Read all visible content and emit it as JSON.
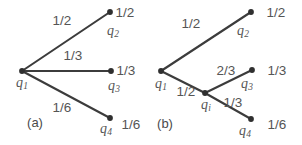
{
  "figure": {
    "caption_a": "(a)",
    "caption_b": "(b)",
    "stroke_color": "#3c3c3c",
    "text_color": "#4a4a4a",
    "background": "#ffffff"
  },
  "panel_a": {
    "root": {
      "name": "q",
      "sub": "1",
      "x": 22,
      "y": 71
    },
    "branches": [
      {
        "edge_label": "1/2",
        "node_name": "q",
        "node_sub": "2",
        "leaf_value": "1/2",
        "x": 110,
        "y": 12
      },
      {
        "edge_label": "1/3",
        "node_name": "q",
        "node_sub": "3",
        "leaf_value": "1/3",
        "x": 111,
        "y": 71
      },
      {
        "edge_label": "1/6",
        "node_name": "q",
        "node_sub": "4",
        "leaf_value": "1/6",
        "x": 110,
        "y": 118
      }
    ]
  },
  "panel_b": {
    "root": {
      "name": "q",
      "sub": "1",
      "x": 161,
      "y": 71
    },
    "inner": {
      "name": "q",
      "sub": "i",
      "x": 205,
      "y": 93
    },
    "root_edges": [
      {
        "label": "1/2",
        "to": "q2"
      },
      {
        "label": "1/2",
        "to": "qi"
      }
    ],
    "inner_edges": [
      {
        "label": "2/3",
        "to": "q3"
      },
      {
        "label": "1/3",
        "to": "q4"
      }
    ],
    "leaves": [
      {
        "node_name": "q",
        "node_sub": "2",
        "leaf_value": "1/2",
        "x": 251,
        "y": 12
      },
      {
        "node_name": "q",
        "node_sub": "3",
        "leaf_value": "1/3",
        "x": 252,
        "y": 70
      },
      {
        "node_name": "q",
        "node_sub": "4",
        "leaf_value": "1/6",
        "x": 251,
        "y": 119
      }
    ]
  },
  "labels": {
    "a_edge_1": "1/2",
    "a_edge_2": "1/3",
    "a_edge_3": "1/6",
    "a_leaf_1": "1/2",
    "a_leaf_2": "1/3",
    "a_leaf_3": "1/6",
    "b_edge_root_up": "1/2",
    "b_edge_root_down": "1/2",
    "b_edge_inner_up": "2/3",
    "b_edge_inner_down": "1/3",
    "b_leaf_1": "1/2",
    "b_leaf_2": "1/3",
    "b_leaf_3": "1/6",
    "q_name": "q",
    "sub_1": "1",
    "sub_2": "2",
    "sub_3": "3",
    "sub_4": "4",
    "sub_i": "i"
  }
}
